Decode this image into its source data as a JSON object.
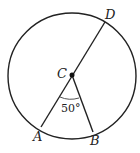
{
  "diagram": {
    "type": "circle-geometry",
    "center_label": "C",
    "points": {
      "A": "A",
      "B": "B",
      "C": "C",
      "D": "D"
    },
    "angle_label": "50°",
    "segments": [
      "AD (diameter through C)",
      "CB (radius)"
    ],
    "angle": {
      "vertex": "C",
      "between": [
        "A",
        "B"
      ],
      "degrees": 50
    }
  }
}
